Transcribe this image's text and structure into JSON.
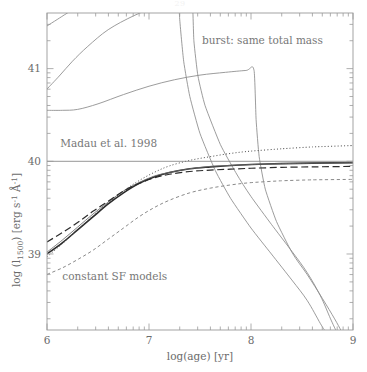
{
  "page": {
    "number": "29"
  },
  "figure": {
    "name": "uv-luminosity-vs-age-figure"
  },
  "chart_data": {
    "type": "line",
    "title": "",
    "xlabel": "log(age) [yr]",
    "ylabel": "log (l_1500) [erg s^-1 A^-1]",
    "ylabel_parts": {
      "prefix": "log (l",
      "subscript": "1500",
      "middle": ") [erg s",
      "sup1": "-1",
      "angstrom": " Å",
      "sup2": "-1",
      "suffix": "]"
    },
    "xlim": [
      6.0,
      9.0
    ],
    "ylim": [
      38.18,
      41.6
    ],
    "xticks": [
      6,
      7,
      8,
      9
    ],
    "xtick_labels": [
      "6",
      "7",
      "8",
      "9"
    ],
    "yticks": [
      39,
      40,
      41
    ],
    "ytick_labels": [
      "39",
      "40",
      "41"
    ],
    "minor_ticks": true,
    "grid": false,
    "legend_position": "none",
    "annotations": [
      {
        "id": "burst-label",
        "text": "burst: same total mass",
        "x": 7.52,
        "y": 41.27
      },
      {
        "id": "madau-label",
        "text": "Madau et al. 1998",
        "x": 6.13,
        "y": 40.15
      },
      {
        "id": "constant-sf-label",
        "text": "constant SF models",
        "x": 6.15,
        "y": 38.72
      }
    ],
    "reference_lines": [
      {
        "id": "madau-1998-level",
        "label": "Madau et al. 1998",
        "orientation": "horizontal",
        "value": 40.0,
        "style": "solid",
        "color": "#8a8a8a",
        "width": 0.9
      }
    ],
    "series": [
      {
        "name": "burst model A (earliest truncation)",
        "group": "burst: same total mass",
        "style": "solid",
        "color": "#8a8a8a",
        "width": 0.85,
        "points": [
          [
            6.0,
            41.46
          ],
          [
            6.1,
            41.53
          ],
          [
            6.2,
            41.6
          ],
          [
            6.38,
            41.72
          ],
          [
            6.6,
            41.85
          ],
          [
            6.85,
            41.95
          ],
          [
            7.05,
            42.02
          ],
          [
            7.2,
            42.06
          ],
          [
            7.28,
            42.07
          ],
          [
            7.3,
            41.55
          ],
          [
            7.34,
            41.08
          ],
          [
            7.4,
            40.7
          ],
          [
            7.5,
            40.3
          ],
          [
            7.65,
            39.9
          ],
          [
            7.8,
            39.6
          ],
          [
            8.0,
            39.28
          ],
          [
            8.2,
            39.0
          ],
          [
            8.4,
            38.72
          ],
          [
            8.55,
            38.5
          ],
          [
            8.68,
            38.25
          ],
          [
            8.72,
            38.18
          ]
        ]
      },
      {
        "name": "burst model B (intermediate truncation)",
        "group": "burst: same total mass",
        "style": "solid",
        "color": "#8a8a8a",
        "width": 0.85,
        "points": [
          [
            6.0,
            40.78
          ],
          [
            6.12,
            40.92
          ],
          [
            6.25,
            41.08
          ],
          [
            6.4,
            41.24
          ],
          [
            6.6,
            41.42
          ],
          [
            6.85,
            41.57
          ],
          [
            7.1,
            41.68
          ],
          [
            7.3,
            41.74
          ],
          [
            7.42,
            41.76
          ],
          [
            7.44,
            41.3
          ],
          [
            7.48,
            40.92
          ],
          [
            7.55,
            40.6
          ],
          [
            7.7,
            40.18
          ],
          [
            7.85,
            39.88
          ],
          [
            8.0,
            39.62
          ],
          [
            8.2,
            39.32
          ],
          [
            8.4,
            39.03
          ],
          [
            8.55,
            38.8
          ],
          [
            8.68,
            38.55
          ],
          [
            8.78,
            38.3
          ],
          [
            8.83,
            38.18
          ]
        ]
      },
      {
        "name": "burst model C (latest truncation)",
        "group": "burst: same total mass",
        "style": "solid",
        "color": "#8a8a8a",
        "width": 0.85,
        "points": [
          [
            6.0,
            40.55
          ],
          [
            6.15,
            40.55
          ],
          [
            6.3,
            40.56
          ],
          [
            6.5,
            40.62
          ],
          [
            6.75,
            40.72
          ],
          [
            7.0,
            40.81
          ],
          [
            7.25,
            40.88
          ],
          [
            7.5,
            40.93
          ],
          [
            7.75,
            40.96
          ],
          [
            7.95,
            40.98
          ],
          [
            8.03,
            40.98
          ],
          [
            8.05,
            40.45
          ],
          [
            8.08,
            40.05
          ],
          [
            8.14,
            39.7
          ],
          [
            8.25,
            39.35
          ],
          [
            8.4,
            39.02
          ],
          [
            8.55,
            38.78
          ],
          [
            8.7,
            38.52
          ],
          [
            8.82,
            38.3
          ],
          [
            8.88,
            38.18
          ]
        ]
      },
      {
        "name": "constant SF (solid, thick)",
        "group": "constant SF models",
        "style": "solid",
        "color": "#2b2b2b",
        "width": 1.6,
        "points": [
          [
            6.0,
            39.0
          ],
          [
            6.15,
            39.12
          ],
          [
            6.3,
            39.26
          ],
          [
            6.45,
            39.4
          ],
          [
            6.6,
            39.54
          ],
          [
            6.75,
            39.66
          ],
          [
            6.9,
            39.76
          ],
          [
            7.05,
            39.83
          ],
          [
            7.2,
            39.88
          ],
          [
            7.4,
            39.92
          ],
          [
            7.6,
            39.94
          ],
          [
            7.8,
            39.955
          ],
          [
            8.0,
            39.965
          ],
          [
            8.3,
            39.975
          ],
          [
            8.6,
            39.98
          ],
          [
            9.0,
            39.985
          ]
        ]
      },
      {
        "name": "constant SF (solid, thin)",
        "group": "constant SF models",
        "style": "solid",
        "color": "#6a6a6a",
        "width": 0.85,
        "points": [
          [
            6.0,
            39.02
          ],
          [
            6.15,
            39.15
          ],
          [
            6.3,
            39.29
          ],
          [
            6.45,
            39.43
          ],
          [
            6.6,
            39.56
          ],
          [
            6.75,
            39.68
          ],
          [
            6.9,
            39.77
          ],
          [
            7.05,
            39.84
          ],
          [
            7.2,
            39.88
          ],
          [
            7.4,
            39.92
          ],
          [
            7.6,
            39.945
          ],
          [
            7.8,
            39.955
          ],
          [
            8.0,
            39.965
          ],
          [
            8.3,
            39.975
          ],
          [
            8.6,
            39.98
          ],
          [
            9.0,
            39.985
          ]
        ]
      },
      {
        "name": "constant SF (dotted)",
        "group": "constant SF models",
        "style": "dotted",
        "color": "#4a4a4a",
        "width": 1.0,
        "points": [
          [
            6.0,
            38.97
          ],
          [
            6.15,
            39.11
          ],
          [
            6.3,
            39.26
          ],
          [
            6.45,
            39.41
          ],
          [
            6.6,
            39.55
          ],
          [
            6.75,
            39.68
          ],
          [
            6.9,
            39.79
          ],
          [
            7.05,
            39.88
          ],
          [
            7.2,
            39.95
          ],
          [
            7.4,
            40.01
          ],
          [
            7.6,
            40.05
          ],
          [
            7.8,
            40.085
          ],
          [
            8.0,
            40.11
          ],
          [
            8.3,
            40.135
          ],
          [
            8.6,
            40.155
          ],
          [
            9.0,
            40.17
          ]
        ]
      },
      {
        "name": "constant SF (long-dashed)",
        "group": "constant SF models",
        "style": "long-dashed",
        "color": "#2b2b2b",
        "width": 1.2,
        "points": [
          [
            6.0,
            39.13
          ],
          [
            6.15,
            39.23
          ],
          [
            6.3,
            39.34
          ],
          [
            6.45,
            39.46
          ],
          [
            6.6,
            39.57
          ],
          [
            6.75,
            39.68
          ],
          [
            6.9,
            39.76
          ],
          [
            7.05,
            39.82
          ],
          [
            7.2,
            39.86
          ],
          [
            7.4,
            39.89
          ],
          [
            7.6,
            39.905
          ],
          [
            7.8,
            39.915
          ],
          [
            8.0,
            39.925
          ],
          [
            8.3,
            39.935
          ],
          [
            8.6,
            39.94
          ],
          [
            9.0,
            39.945
          ]
        ]
      },
      {
        "name": "constant SF (short-dashed, lowest)",
        "group": "constant SF models",
        "style": "short-dashed",
        "color": "#8a8a8a",
        "width": 1.0,
        "points": [
          [
            6.0,
            38.78
          ],
          [
            6.15,
            38.85
          ],
          [
            6.3,
            38.94
          ],
          [
            6.45,
            39.04
          ],
          [
            6.6,
            39.16
          ],
          [
            6.75,
            39.28
          ],
          [
            6.9,
            39.4
          ],
          [
            7.05,
            39.5
          ],
          [
            7.2,
            39.58
          ],
          [
            7.4,
            39.66
          ],
          [
            7.6,
            39.71
          ],
          [
            7.8,
            39.745
          ],
          [
            8.0,
            39.77
          ],
          [
            8.3,
            39.79
          ],
          [
            8.6,
            39.8
          ],
          [
            9.0,
            39.805
          ]
        ]
      }
    ]
  }
}
